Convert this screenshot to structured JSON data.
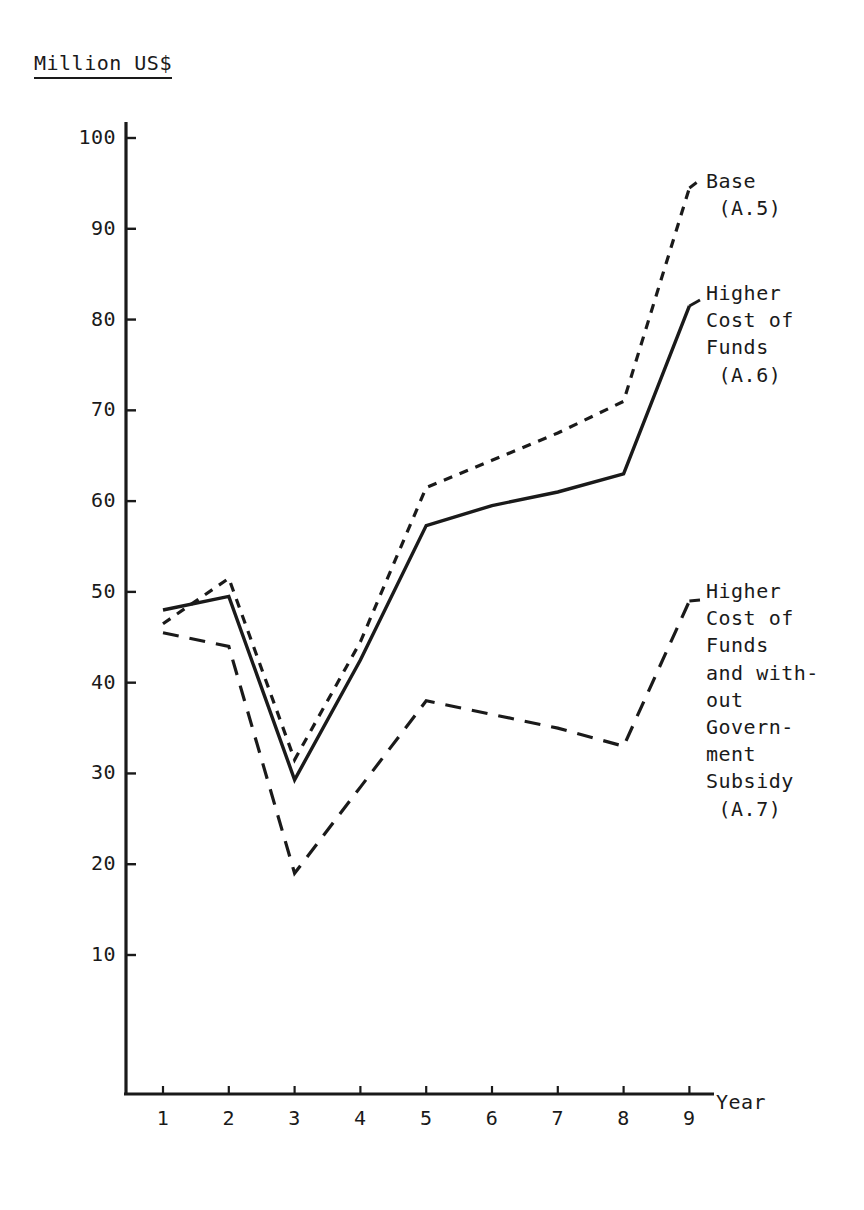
{
  "figure": {
    "y_axis_title": "Million US$",
    "x_axis_title": "Year"
  },
  "chart_data": {
    "type": "line",
    "title": "Million US$",
    "xlabel": "Year",
    "ylabel": "Million US$",
    "xlim": [
      0,
      9.6
    ],
    "ylim": [
      0,
      103
    ],
    "grid": false,
    "legend_position": "right-inline",
    "x": [
      1,
      2,
      3,
      4,
      5,
      6,
      7,
      8,
      9
    ],
    "yticks": [
      10,
      20,
      30,
      40,
      50,
      60,
      70,
      80,
      90,
      100
    ],
    "xticks": [
      1,
      2,
      3,
      4,
      5,
      6,
      7,
      8,
      9
    ],
    "series": [
      {
        "name": "Base (A.5)",
        "label_lines": [
          "Base",
          " (A.5)"
        ],
        "style": "dotted",
        "color": "#1a1a1a",
        "values": [
          46.5,
          51.5,
          31.5,
          44.5,
          61.5,
          64.5,
          67.5,
          71.0,
          94.5
        ]
      },
      {
        "name": "Higher Cost of Funds (A.6)",
        "label_lines": [
          "Higher",
          "Cost of",
          "Funds",
          " (A.6)"
        ],
        "style": "solid",
        "color": "#1a1a1a",
        "values": [
          48.0,
          49.5,
          29.3,
          42.5,
          57.3,
          59.5,
          61.0,
          63.0,
          81.5
        ]
      },
      {
        "name": "Higher Cost of Funds and without Government Subsidy (A.7)",
        "label_lines": [
          "Higher",
          "Cost of",
          "Funds",
          "and with-",
          "out",
          "Govern-",
          "ment",
          "Subsidy",
          " (A.7)"
        ],
        "style": "dashed",
        "color": "#1a1a1a",
        "values": [
          45.5,
          44.0,
          19.0,
          28.5,
          38.0,
          36.5,
          35.0,
          33.0,
          49.0
        ]
      }
    ]
  },
  "ytick_labels": [
    "100",
    "90",
    "80",
    "70",
    "60",
    "50",
    "40",
    "30",
    "20",
    "10"
  ],
  "xtick_labels": [
    "1",
    "2",
    "3",
    "4",
    "5",
    "6",
    "7",
    "8",
    "9"
  ],
  "legend": {
    "a5": "Base\n (A.5)",
    "a6": "Higher\nCost of\nFunds\n (A.6)",
    "a7": "Higher\nCost of\nFunds\nand with-\nout\nGovern-\nment\nSubsidy\n (A.7)"
  }
}
